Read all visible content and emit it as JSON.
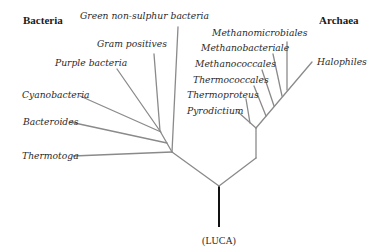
{
  "diagram": {
    "type": "phylogenetic-tree",
    "groups": {
      "bacteria": "Bacteria",
      "archaea": "Archaea"
    },
    "root_label": "(LUCA)",
    "bacteria_taxa": [
      "Green non-sulphur bacteria",
      "Gram positives",
      "Purple bacteria",
      "Cyanobacteria",
      "Bacteroides",
      "Thermotoga"
    ],
    "archaea_taxa": [
      "Methanomicrobiales",
      "Methanobacteriale",
      "Methanococcales",
      "Thermococcales",
      "Thermoproteus",
      "Pyrodictium",
      "Halophiles"
    ],
    "colors": {
      "branch": "#8a8a8a",
      "root_stem": "#111111",
      "text": "#2a2a2a"
    }
  }
}
